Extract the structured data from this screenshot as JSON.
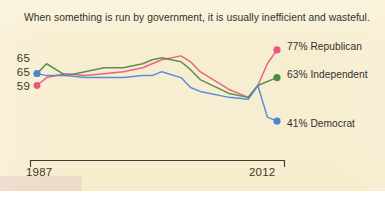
{
  "chart_data": {
    "type": "line",
    "title": "When something is run by government, it is usually inefficient and wasteful.",
    "xlabel": "",
    "ylabel": "",
    "grid": false,
    "legend_position": "right-inline-endpoint",
    "x_tick_labels": [
      "1987",
      "2012"
    ],
    "xlim": [
      1987,
      2012
    ],
    "ylim": [
      38,
      80
    ],
    "y_start_labels": [
      "65",
      "65",
      "59"
    ],
    "annotations": [
      "65",
      "65",
      "59",
      "77% Republican",
      "63% Independent",
      "41% Democrat"
    ],
    "series": [
      {
        "name": "Republican",
        "color": "#e8587f",
        "start_label": "59",
        "end_label": "77% Republican",
        "end_value": 77,
        "start_value": 59,
        "x": [
          1987,
          1988,
          1990,
          1992,
          1994,
          1996,
          1998,
          1999,
          2000,
          2002,
          2003,
          2004,
          2007,
          2009,
          2010,
          2011,
          2012
        ],
        "values": [
          59,
          63,
          65,
          64,
          65,
          66,
          68,
          70,
          72,
          74,
          71,
          66,
          57,
          53,
          59,
          70,
          77
        ]
      },
      {
        "name": "Independent",
        "color": "#4f8a3d",
        "start_label": "65",
        "end_label": "63% Independent",
        "end_value": 63,
        "start_value": 65,
        "x": [
          1987,
          1988,
          1990,
          1992,
          1994,
          1996,
          1998,
          1999,
          2000,
          2002,
          2003,
          2004,
          2007,
          2009,
          2010,
          2011,
          2012
        ],
        "values": [
          65,
          70,
          64,
          66,
          68,
          68,
          70,
          72,
          73,
          71,
          67,
          62,
          55,
          53,
          59,
          61,
          63
        ]
      },
      {
        "name": "Democrat",
        "color": "#4a86d8",
        "start_label": "65",
        "end_label": "41% Democrat",
        "end_value": 41,
        "start_value": 65,
        "x": [
          1987,
          1988,
          1990,
          1992,
          1994,
          1996,
          1998,
          1999,
          2000,
          2002,
          2003,
          2004,
          2007,
          2009,
          2010,
          2011,
          2012
        ],
        "values": [
          65,
          64,
          64,
          63,
          63,
          63,
          64,
          64,
          66,
          63,
          58,
          56,
          53,
          52,
          59,
          43,
          41
        ]
      }
    ]
  },
  "legend": {
    "items": [
      {
        "label": "77% Republican",
        "color": "#e8587f"
      },
      {
        "label": "63% Independent",
        "color": "#4f8a3d"
      },
      {
        "label": "41% Democrat",
        "color": "#4a86d8"
      }
    ]
  },
  "axis": {
    "y_labels": [
      "65",
      "65",
      "59"
    ],
    "x_labels": [
      "1987",
      "2012"
    ]
  },
  "colors": {
    "paper": "#f7eed2",
    "ink": "#33312c",
    "republican": "#e8587f",
    "independent": "#4f8a3d",
    "democrat": "#4a86d8",
    "axis": "#3f3c33"
  }
}
